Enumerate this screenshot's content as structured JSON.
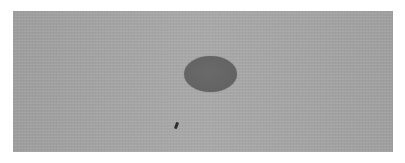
{
  "image": {
    "description": "Grayscale photograph of a flat gray textured surface with a dark oval spot near the center and a small dark speck below-left",
    "background_color": "#a8a8a8",
    "objects": [
      {
        "name": "dark-oval",
        "color": "#646464",
        "center": [
          211,
          74
        ],
        "size": [
          53,
          36
        ]
      },
      {
        "name": "small-speck",
        "color": "#2e2e2e",
        "center": [
          176,
          126
        ],
        "size": [
          3,
          7
        ]
      }
    ]
  }
}
